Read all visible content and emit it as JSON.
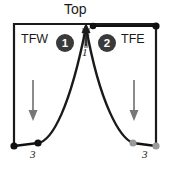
{
  "diagram": {
    "type": "cross-section-schematic",
    "title_label": "Top",
    "region_left_label": "TFW",
    "region_right_label": "TFE",
    "badges": [
      {
        "name": "badge-1",
        "label": "1",
        "x": 65,
        "y": 43
      },
      {
        "name": "badge-2",
        "label": "2",
        "x": 107,
        "y": 43
      }
    ],
    "annotations": [
      {
        "name": "apex-number",
        "label": "1",
        "x": 86,
        "y": 51,
        "style": "italic"
      },
      {
        "name": "left-baseline-number",
        "label": "3",
        "x": 34,
        "y": 153,
        "style": "italic"
      },
      {
        "name": "right-baseline-number",
        "label": "3",
        "x": 146,
        "y": 153,
        "style": "italic"
      }
    ],
    "frame": {
      "x": 13,
      "y": 23,
      "width": 144,
      "height": 122,
      "stroke": "#1a1a1a"
    },
    "peak": {
      "apex_x": 86,
      "apex_y": 26,
      "left_foot_x": 38,
      "left_foot_y": 144,
      "right_foot_x": 133,
      "right_foot_y": 143
    },
    "apex_arrow": {
      "name": "apex-up-arrow",
      "direction": "up",
      "x": 86,
      "y_from": 44,
      "y_to": 24,
      "color": "#1a1a1a"
    },
    "apex_wedge": {
      "name": "apex-gray-wedge",
      "color": "#8c8c8c"
    },
    "top_right_connector": {
      "name": "top-right-connector",
      "x_from": 93,
      "x_to": 156,
      "y": 26,
      "endpoint_color": "#111111"
    },
    "flow_arrows": [
      {
        "name": "left-down-arrow",
        "direction": "down",
        "x": 33,
        "y_from": 80,
        "y_to": 120,
        "color": "#777777"
      },
      {
        "name": "right-down-arrow",
        "direction": "down",
        "x": 134,
        "y_from": 80,
        "y_to": 120,
        "color": "#777777"
      }
    ],
    "baseline_segments": [
      {
        "name": "left-baseline-segment",
        "x_from": 13,
        "x_to": 38,
        "y_from": 146,
        "y_to": 143,
        "endpoint_color": "#111111"
      },
      {
        "name": "right-baseline-segment",
        "x_from": 133,
        "x_to": 157,
        "y_from": 143,
        "y_to": 146,
        "endpoint_color": "#9a9a9a"
      }
    ],
    "colors": {
      "stroke": "#1a1a1a",
      "badge_fill": "#3a3a3a",
      "badge_text": "#ffffff",
      "gray_arrow": "#777777",
      "gray_point": "#9a9a9a",
      "wedge": "#8c8c8c",
      "background": "#ffffff"
    }
  }
}
